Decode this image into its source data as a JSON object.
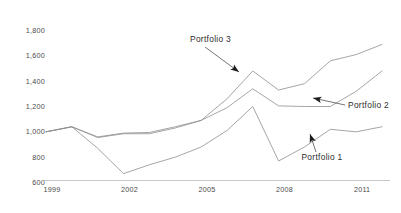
{
  "chart_data": {
    "type": "line",
    "title": "",
    "xlabel": "",
    "ylabel": "",
    "xlim": [
      1999,
      2012
    ],
    "ylim": [
      600,
      1800
    ],
    "grid": false,
    "legend_position": "inline-annotations",
    "x": [
      1999,
      2000,
      2001,
      2002,
      2003,
      2004,
      2005,
      2006,
      2007,
      2008,
      2009,
      2010,
      2011,
      2012
    ],
    "x_tick_labels": [
      "1999",
      "2002",
      "2005",
      "2008",
      "2011"
    ],
    "x_tick_values": [
      1999,
      2002,
      2005,
      2008,
      2011
    ],
    "y_tick_labels": [
      "1,800",
      "1,600",
      "1,400",
      "1,200",
      "1,000",
      "800",
      "600"
    ],
    "y_tick_values": [
      1800,
      1600,
      1400,
      1200,
      1000,
      800,
      600
    ],
    "series": [
      {
        "name": "Portfolio 1",
        "values": [
          1000,
          1040,
          870,
          670,
          740,
          800,
          880,
          1010,
          1200,
          770,
          880,
          1020,
          1000,
          1040
        ]
      },
      {
        "name": "Portfolio 2",
        "values": [
          1000,
          1040,
          955,
          985,
          985,
          1030,
          1090,
          1190,
          1340,
          1205,
          1200,
          1200,
          1320,
          1480
        ]
      },
      {
        "name": "Portfolio 3",
        "values": [
          1000,
          1040,
          960,
          990,
          995,
          1040,
          1090,
          1260,
          1480,
          1330,
          1380,
          1560,
          1610,
          1690
        ]
      }
    ],
    "annotations": [
      {
        "text": "Portfolio 3",
        "target_x": 2007,
        "target_y": 1480
      },
      {
        "text": "Portfolio 2",
        "target_x": 2010,
        "target_y": 1200
      },
      {
        "text": "Portfolio 1",
        "target_x": 2010,
        "target_y": 1020
      }
    ],
    "colors": {
      "line": "#8e8e8e",
      "axis": "#b9b9b9",
      "tick_text": "#4a4a4a",
      "annotation_text": "#2e2e2e",
      "arrow": "#1c1c1c",
      "background": "#ffffff"
    }
  }
}
